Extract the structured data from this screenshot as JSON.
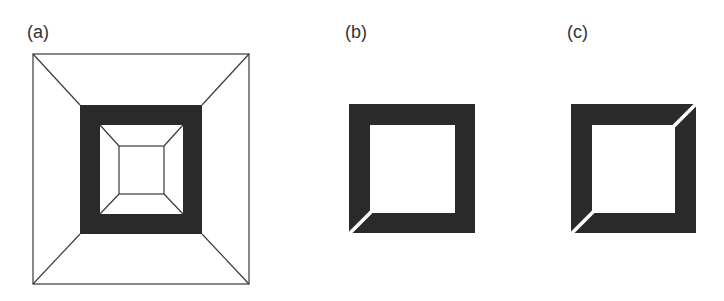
{
  "panels": [
    {
      "label": "(a)",
      "description": "Square frustum wireframe with dark band",
      "outer_square": [
        33,
        54,
        249,
        284
      ],
      "dark_band": [
        80,
        105,
        202,
        234
      ],
      "inner_square": [
        100,
        125,
        183,
        214
      ],
      "innermost_square": [
        119,
        146,
        164,
        194
      ]
    },
    {
      "label": "(b)",
      "description": "Dark square ring with single diagonal cut at bottom-left corner",
      "outer": [
        349,
        104,
        475,
        233
      ],
      "inner": [
        370,
        125,
        455,
        213
      ],
      "cuts": [
        "bottom-left"
      ]
    },
    {
      "label": "(c)",
      "description": "Dark square ring with two diagonal cuts at top-right and bottom-left corners",
      "outer": [
        571,
        104,
        696,
        233
      ],
      "inner": [
        592,
        125,
        675,
        213
      ],
      "cuts": [
        "top-right",
        "bottom-left"
      ]
    }
  ],
  "colors": {
    "fill": "#2a2a2a",
    "line": "#3a3a3a",
    "background": "#ffffff"
  }
}
